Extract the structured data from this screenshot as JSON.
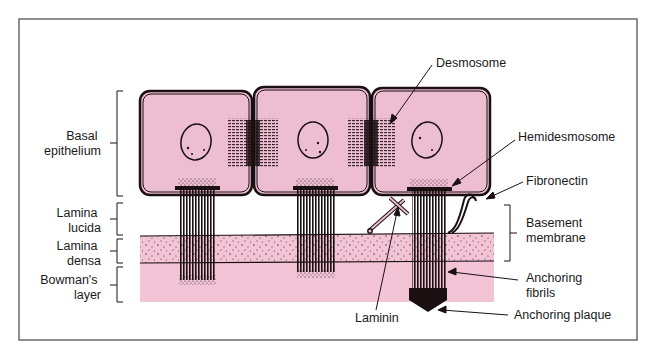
{
  "diagram": {
    "colors": {
      "cell_fill": "#edbdd2",
      "tissue_fill": "#f2c4d6",
      "outline": "#1a1012",
      "frame": "#6a6a6a",
      "background": "#ffffff"
    },
    "left_labels": [
      {
        "id": "basal-epithelium",
        "lines": [
          "Basal",
          "epithelium"
        ]
      },
      {
        "id": "lamina-lucida",
        "lines": [
          "Lamina",
          "lucida"
        ]
      },
      {
        "id": "lamina-densa",
        "lines": [
          "Lamina",
          "densa"
        ]
      },
      {
        "id": "bowmans-layer",
        "lines": [
          "Bowman's",
          "layer"
        ]
      }
    ],
    "right_labels": {
      "desmosome": "Desmosome",
      "hemidesmosome": "Hemidesmosome",
      "fibronectin": "Fibronectin",
      "basement_membrane": [
        "Basement",
        "membrane"
      ],
      "anchoring_fibrils": [
        "Anchoring",
        "fibrils"
      ],
      "anchoring_plaque": "Anchoring plaque",
      "laminin": "Laminin"
    },
    "cells": [
      {
        "name": "basal-cell-1"
      },
      {
        "name": "basal-cell-2"
      },
      {
        "name": "basal-cell-3"
      }
    ]
  }
}
